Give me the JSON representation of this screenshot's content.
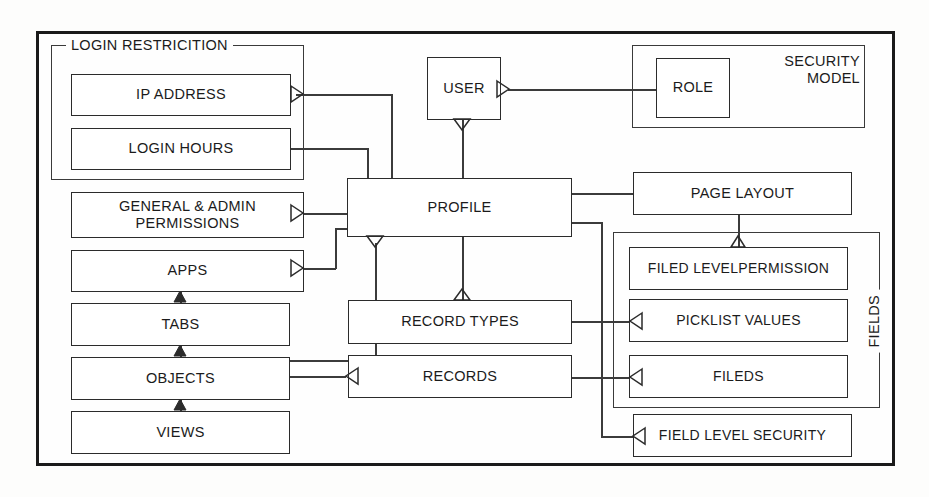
{
  "diagram": {
    "title": "Security Model",
    "groups": {
      "login_restriction": {
        "label": "LOGIN RESTRICITION"
      },
      "security_model": {
        "label_line1": "SECURITY",
        "label_line2": "MODEL"
      },
      "fields": {
        "label": "FIELDS"
      }
    },
    "entities": {
      "ip_address": "IP ADDRESS",
      "login_hours": "LOGIN HOURS",
      "general_admin_permissions": "GENERAL & ADMIN PERMISSIONS",
      "apps": "APPS",
      "tabs": "TABS",
      "objects": "OBJECTS",
      "views": "VIEWS",
      "user": "USER",
      "role": "ROLE",
      "profile": "PROFILE",
      "record_types": "RECORD TYPES",
      "records": "RECORDS",
      "page_layout": "PAGE LAYOUT",
      "field_level_permission": "FILED LEVELPERMISSION",
      "picklist_values": "PICKLIST VALUES",
      "fields_entity": "FILEDS",
      "field_level_security": "FIELD LEVEL SECURITY"
    },
    "colors": {
      "frame": "#1a1a1a",
      "box_border": "#2b2b2b",
      "line": "#3b3b3b",
      "text": "#1b1b1b",
      "background": "#fdfdfc"
    }
  }
}
